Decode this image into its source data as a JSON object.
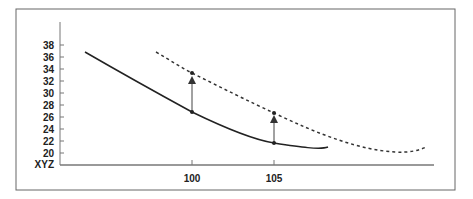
{
  "chart_data": {
    "type": "line",
    "title": "",
    "xlabel": "",
    "ylabel": "XYZ",
    "y_ticks": [
      "38",
      "36",
      "34",
      "32",
      "30",
      "28",
      "26",
      "24",
      "22",
      "20"
    ],
    "y_axis_origin_label": "XYZ",
    "x_ticks": [
      "100",
      "105"
    ],
    "ylim": [
      18,
      40
    ],
    "grid": false,
    "legend": null,
    "series": [
      {
        "name": "original curve (solid)",
        "style": "solid",
        "points": [
          {
            "x": 100,
            "y": 26.7
          },
          {
            "x": 105,
            "y": 21.6
          }
        ]
      },
      {
        "name": "shifted curve (dashed)",
        "style": "dashed",
        "points": [
          {
            "x": 100,
            "y": 33.2
          },
          {
            "x": 105,
            "y": 26.6
          }
        ]
      }
    ],
    "annotations": [
      {
        "type": "arrow",
        "x": 100,
        "from": 26.7,
        "to": 33.2
      },
      {
        "type": "arrow",
        "x": 105,
        "from": 21.6,
        "to": 26.6
      }
    ]
  }
}
